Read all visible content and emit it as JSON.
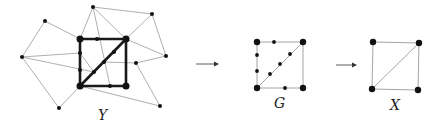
{
  "labels": {
    "y": "Y",
    "g": "G",
    "x": "X"
  },
  "colors": {
    "thin_edge": "#9a9a9a",
    "thick_edge": "#1a1a1a",
    "node": "#111111",
    "arrow": "#333333"
  },
  "graph_Y": {
    "outer_nodes": [
      [
        93,
        7
      ],
      [
        45,
        21
      ],
      [
        22,
        57
      ],
      [
        152,
        14
      ],
      [
        166,
        56
      ],
      [
        59,
        108
      ],
      [
        160,
        106
      ]
    ],
    "square": [
      [
        80,
        39
      ],
      [
        126,
        39
      ],
      [
        126,
        86
      ],
      [
        80,
        86
      ]
    ],
    "subdivision_nodes": [
      [
        97,
        39
      ],
      [
        80,
        53
      ],
      [
        80,
        70
      ],
      [
        114,
        52
      ],
      [
        104,
        62
      ],
      [
        94,
        72
      ],
      [
        110,
        86
      ],
      [
        136,
        63
      ]
    ]
  },
  "graph_G": {
    "corners": [
      [
        257,
        42
      ],
      [
        303,
        42
      ],
      [
        303,
        88
      ],
      [
        257,
        88
      ]
    ],
    "subdivision_nodes": [
      [
        274,
        42
      ],
      [
        257,
        55
      ],
      [
        257,
        71
      ],
      [
        290,
        54
      ],
      [
        280,
        64
      ],
      [
        270,
        74
      ],
      [
        285,
        88
      ]
    ]
  },
  "graph_X": {
    "corners": [
      [
        373,
        42
      ],
      [
        419,
        43
      ],
      [
        418,
        90
      ],
      [
        372,
        89
      ]
    ]
  },
  "arrows": [
    [
      196,
      64,
      218,
      64
    ],
    [
      336,
      65,
      357,
      65
    ]
  ]
}
